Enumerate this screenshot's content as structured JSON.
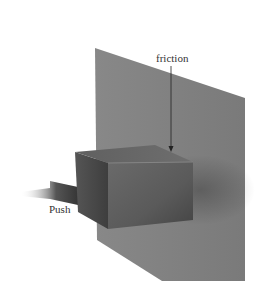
{
  "diagram": {
    "labels": {
      "friction": "friction",
      "push": "Push"
    },
    "colors": {
      "background": "#ffffff",
      "wall": "#7a7a7a",
      "box_front": "#5c5c5c",
      "box_top": "#6a6a6a",
      "box_side": "#4a4a4a",
      "arrow": "#222222",
      "text": "#333333"
    }
  }
}
